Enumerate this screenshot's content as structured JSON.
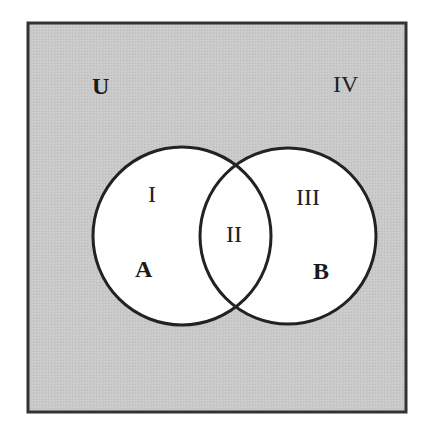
{
  "diagram": {
    "type": "venn",
    "universe_label": "U",
    "sets": [
      {
        "label": "A",
        "cx": 182,
        "cy": 236,
        "r": 90
      },
      {
        "label": "B",
        "cx": 288,
        "cy": 236,
        "r": 89
      }
    ],
    "regions": [
      {
        "id": "I",
        "label": "I",
        "description": "A only"
      },
      {
        "id": "II",
        "label": "II",
        "description": "A and B"
      },
      {
        "id": "III",
        "label": "III",
        "description": "B only"
      },
      {
        "id": "IV",
        "label": "IV",
        "description": "outside A and B"
      }
    ],
    "colors": {
      "universe_fill": "#c8c8c8",
      "circle_fill": "#ffffff",
      "stroke": "#222222"
    }
  }
}
